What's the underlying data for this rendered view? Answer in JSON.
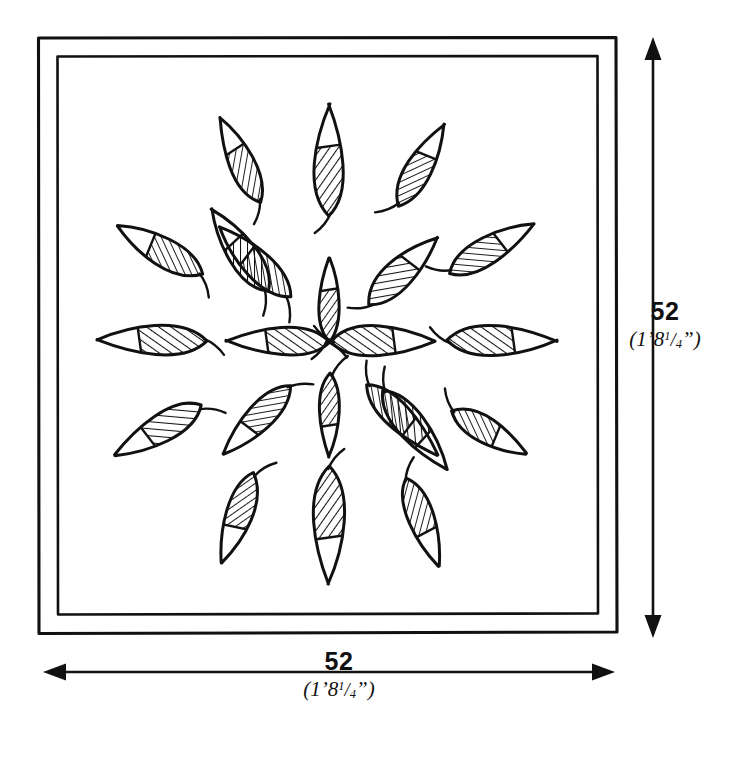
{
  "drawing": {
    "title": "Square panel with radial leaf motif",
    "panel": {
      "frame_style": "double-line border",
      "outer": {
        "x": 38,
        "y": 37,
        "width": 579,
        "height": 596
      },
      "inner": {
        "x": 57,
        "y": 56,
        "width": 541,
        "height": 558
      }
    },
    "motif": {
      "name": "radial-leaf-rosette",
      "leaf_count": 20,
      "center": {
        "x": 329,
        "y": 340
      },
      "hatching": "diagonal line fill on inner half of each leaf",
      "rings": [
        {
          "name": "inner-ring",
          "count": 8,
          "radius": 75
        },
        {
          "name": "outer-ring",
          "count": 12,
          "radius": 165
        }
      ],
      "leaves": [
        {
          "id": 1,
          "ring": "inner",
          "cx": 329,
          "cy": 300,
          "angle": 0,
          "length": 84,
          "width": 34,
          "stem": true
        },
        {
          "id": 2,
          "ring": "inner",
          "cx": 403,
          "cy": 271,
          "angle": 45,
          "length": 96,
          "width": 48,
          "stem": true
        },
        {
          "id": 3,
          "ring": "inner",
          "cx": 383,
          "cy": 341,
          "angle": 90,
          "length": 104,
          "width": 50,
          "stem": true
        },
        {
          "id": 4,
          "ring": "inner",
          "cx": 402,
          "cy": 420,
          "angle": 135,
          "length": 100,
          "width": 46,
          "stem": true
        },
        {
          "id": 5,
          "ring": "inner",
          "cx": 329,
          "cy": 415,
          "angle": 180,
          "length": 84,
          "width": 34,
          "stem": true
        },
        {
          "id": 6,
          "ring": "inner",
          "cx": 257,
          "cy": 420,
          "angle": 225,
          "length": 96,
          "width": 44,
          "stem": true
        },
        {
          "id": 7,
          "ring": "inner",
          "cx": 278,
          "cy": 341,
          "angle": 270,
          "length": 104,
          "width": 48,
          "stem": true
        },
        {
          "id": 8,
          "ring": "inner",
          "cx": 255,
          "cy": 262,
          "angle": 315,
          "length": 100,
          "width": 46,
          "stem": true
        },
        {
          "id": 9,
          "ring": "outer",
          "cx": 329,
          "cy": 160,
          "angle": 0,
          "length": 112,
          "width": 50,
          "stem": true
        },
        {
          "id": 10,
          "ring": "outer",
          "cx": 421,
          "cy": 165,
          "angle": 30,
          "length": 94,
          "width": 44,
          "stem": true
        },
        {
          "id": 11,
          "ring": "outer",
          "cx": 492,
          "cy": 249,
          "angle": 60,
          "length": 98,
          "width": 46,
          "stem": true
        },
        {
          "id": 12,
          "ring": "outer",
          "cx": 502,
          "cy": 341,
          "angle": 90,
          "length": 110,
          "width": 50,
          "stem": true
        },
        {
          "id": 13,
          "ring": "outer",
          "cx": 489,
          "cy": 432,
          "angle": 120,
          "length": 86,
          "width": 42,
          "stem": true
        },
        {
          "id": 14,
          "ring": "outer",
          "cx": 415,
          "cy": 430,
          "angle": 140,
          "length": 102,
          "width": 48,
          "stem": true
        },
        {
          "id": 15,
          "ring": "outer",
          "cx": 423,
          "cy": 522,
          "angle": 160,
          "length": 94,
          "width": 44,
          "stem": true
        },
        {
          "id": 16,
          "ring": "outer",
          "cx": 329,
          "cy": 525,
          "angle": 180,
          "length": 118,
          "width": 54,
          "stem": true
        },
        {
          "id": 17,
          "ring": "outer",
          "cx": 238,
          "cy": 518,
          "angle": 200,
          "length": 96,
          "width": 44,
          "stem": true
        },
        {
          "id": 18,
          "ring": "outer",
          "cx": 158,
          "cy": 430,
          "angle": 240,
          "length": 100,
          "width": 48,
          "stem": true
        },
        {
          "id": 19,
          "ring": "outer",
          "cx": 152,
          "cy": 340,
          "angle": 270,
          "length": 110,
          "width": 50,
          "stem": true
        },
        {
          "id": 20,
          "ring": "outer",
          "cx": 160,
          "cy": 250,
          "angle": 300,
          "length": 98,
          "width": 46,
          "stem": true
        },
        {
          "id": 21,
          "ring": "outer",
          "cx": 240,
          "cy": 250,
          "angle": 325,
          "length": 100,
          "width": 48,
          "stem": true
        },
        {
          "id": 22,
          "ring": "outer",
          "cx": 240,
          "cy": 160,
          "angle": 335,
          "length": 94,
          "width": 42,
          "stem": true
        }
      ]
    },
    "dimensions": {
      "right": {
        "value": "52",
        "imperial_feet": "1",
        "imperial_inches": "8",
        "imperial_frac_num": "1",
        "imperial_frac_den": "4",
        "imperial_text": "(1'8 1/4\")",
        "orientation": "vertical",
        "arrow_x": 653,
        "arrow_top": 40,
        "arrow_bottom": 635
      },
      "bottom": {
        "value": "52",
        "imperial_feet": "1",
        "imperial_inches": "8",
        "imperial_frac_num": "1",
        "imperial_frac_den": "4",
        "imperial_text": "(1'8 1/4\")",
        "orientation": "horizontal",
        "arrow_y": 672,
        "arrow_left": 44,
        "arrow_right": 613
      }
    },
    "colors": {
      "ink": "#111111",
      "background": "#ffffff"
    }
  }
}
